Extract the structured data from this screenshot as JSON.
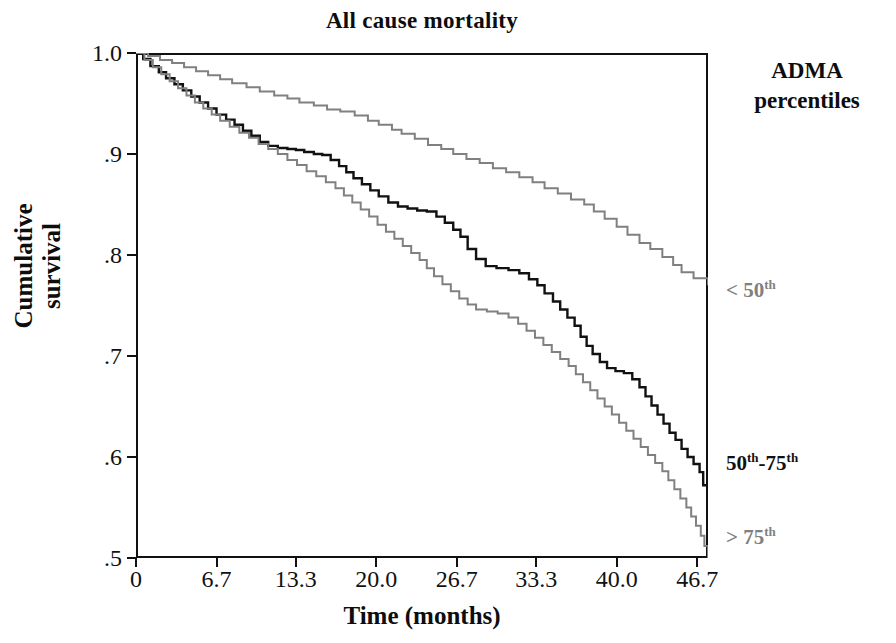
{
  "chart_data": {
    "type": "line",
    "title": "All cause mortality",
    "xlabel": "Time (months)",
    "ylabel": "Cumulative survival",
    "xlim": [
      0,
      47.6
    ],
    "ylim": [
      0.5,
      1.0
    ],
    "grid": false,
    "legend_position": "right",
    "legend_title_line1": "ADMA",
    "legend_title_line2": "percentiles",
    "xticks": [
      0,
      6.7,
      13.3,
      20.0,
      26.7,
      33.3,
      40.0,
      46.7
    ],
    "xtick_labels": [
      "0",
      "6.7",
      "13.3",
      "20.0",
      "26.7",
      "33.3",
      "40.0",
      "46.7"
    ],
    "yticks": [
      1.0,
      0.9,
      0.8,
      0.7,
      0.6,
      0.5
    ],
    "ytick_labels": [
      "1.0",
      ".9",
      ".8",
      ".7",
      ".6",
      ".5"
    ],
    "series": [
      {
        "name": "< 50th",
        "label_prefix": "< 50",
        "label_sup": "th",
        "color": "#808080",
        "width": 2.0,
        "label_y": 277,
        "final_value": 0.77,
        "points": [
          [
            0.0,
            1.0
          ],
          [
            1.0,
            0.997
          ],
          [
            2.0,
            0.993
          ],
          [
            3.0,
            0.99
          ],
          [
            4.0,
            0.986
          ],
          [
            5.0,
            0.982
          ],
          [
            6.0,
            0.978
          ],
          [
            7.0,
            0.974
          ],
          [
            8.0,
            0.97
          ],
          [
            9.2,
            0.966
          ],
          [
            10.3,
            0.962
          ],
          [
            11.5,
            0.958
          ],
          [
            12.6,
            0.955
          ],
          [
            13.6,
            0.951
          ],
          [
            14.8,
            0.948
          ],
          [
            15.9,
            0.944
          ],
          [
            17.0,
            0.942
          ],
          [
            18.2,
            0.938
          ],
          [
            19.3,
            0.933
          ],
          [
            20.2,
            0.929
          ],
          [
            21.3,
            0.924
          ],
          [
            22.1,
            0.92
          ],
          [
            23.2,
            0.915
          ],
          [
            24.3,
            0.909
          ],
          [
            25.4,
            0.905
          ],
          [
            26.4,
            0.9
          ],
          [
            27.5,
            0.895
          ],
          [
            28.6,
            0.891
          ],
          [
            29.7,
            0.886
          ],
          [
            30.8,
            0.882
          ],
          [
            31.9,
            0.877
          ],
          [
            33.0,
            0.872
          ],
          [
            34.0,
            0.866
          ],
          [
            35.1,
            0.861
          ],
          [
            36.2,
            0.855
          ],
          [
            37.3,
            0.85
          ],
          [
            38.1,
            0.843
          ],
          [
            39.0,
            0.836
          ],
          [
            40.0,
            0.828
          ],
          [
            40.9,
            0.82
          ],
          [
            41.9,
            0.812
          ],
          [
            42.8,
            0.806
          ],
          [
            43.8,
            0.798
          ],
          [
            44.7,
            0.79
          ],
          [
            45.4,
            0.783
          ],
          [
            46.4,
            0.777
          ],
          [
            47.6,
            0.77
          ]
        ]
      },
      {
        "name": "50th-75th",
        "label_prefix": "50",
        "label_sup": "th",
        "label_suffix": "-75",
        "label_sup2": "th",
        "color": "#111111",
        "width": 2.4,
        "label_y": 450,
        "final_value": 0.555,
        "points": [
          [
            0.0,
            1.0
          ],
          [
            0.6,
            0.994
          ],
          [
            1.2,
            0.987
          ],
          [
            1.9,
            0.981
          ],
          [
            2.5,
            0.975
          ],
          [
            3.2,
            0.969
          ],
          [
            3.9,
            0.963
          ],
          [
            4.6,
            0.957
          ],
          [
            5.3,
            0.951
          ],
          [
            6.0,
            0.945
          ],
          [
            6.7,
            0.939
          ],
          [
            7.5,
            0.934
          ],
          [
            8.2,
            0.929
          ],
          [
            8.9,
            0.923
          ],
          [
            9.6,
            0.918
          ],
          [
            10.3,
            0.912
          ],
          [
            11.0,
            0.908
          ],
          [
            11.8,
            0.906
          ],
          [
            12.6,
            0.905
          ],
          [
            13.3,
            0.904
          ],
          [
            14.0,
            0.902
          ],
          [
            14.8,
            0.9
          ],
          [
            15.5,
            0.899
          ],
          [
            16.2,
            0.894
          ],
          [
            16.9,
            0.888
          ],
          [
            17.5,
            0.882
          ],
          [
            18.1,
            0.876
          ],
          [
            18.8,
            0.87
          ],
          [
            19.5,
            0.864
          ],
          [
            20.2,
            0.858
          ],
          [
            21.0,
            0.852
          ],
          [
            21.8,
            0.848
          ],
          [
            22.6,
            0.846
          ],
          [
            23.4,
            0.844
          ],
          [
            24.2,
            0.843
          ],
          [
            25.0,
            0.838
          ],
          [
            25.7,
            0.832
          ],
          [
            26.4,
            0.825
          ],
          [
            27.0,
            0.818
          ],
          [
            27.6,
            0.806
          ],
          [
            28.3,
            0.796
          ],
          [
            29.1,
            0.789
          ],
          [
            30.0,
            0.787
          ],
          [
            31.0,
            0.785
          ],
          [
            31.9,
            0.782
          ],
          [
            32.7,
            0.776
          ],
          [
            33.4,
            0.77
          ],
          [
            34.0,
            0.762
          ],
          [
            34.7,
            0.754
          ],
          [
            35.3,
            0.746
          ],
          [
            35.9,
            0.738
          ],
          [
            36.5,
            0.73
          ],
          [
            37.0,
            0.719
          ],
          [
            37.5,
            0.71
          ],
          [
            38.0,
            0.702
          ],
          [
            38.6,
            0.694
          ],
          [
            39.2,
            0.688
          ],
          [
            39.9,
            0.685
          ],
          [
            40.6,
            0.683
          ],
          [
            41.3,
            0.677
          ],
          [
            41.9,
            0.669
          ],
          [
            42.4,
            0.66
          ],
          [
            42.9,
            0.651
          ],
          [
            43.4,
            0.642
          ],
          [
            43.9,
            0.633
          ],
          [
            44.4,
            0.624
          ],
          [
            44.9,
            0.617
          ],
          [
            45.4,
            0.608
          ],
          [
            45.9,
            0.6
          ],
          [
            46.4,
            0.593
          ],
          [
            46.9,
            0.585
          ],
          [
            47.2,
            0.572
          ],
          [
            47.6,
            0.555
          ]
        ]
      },
      {
        "name": "> 75th",
        "label_prefix": "> 75",
        "label_sup": "th",
        "color": "#808080",
        "width": 2.0,
        "label_y": 524,
        "final_value": 0.5,
        "points": [
          [
            0.0,
            1.0
          ],
          [
            0.7,
            0.993
          ],
          [
            1.4,
            0.986
          ],
          [
            2.1,
            0.979
          ],
          [
            2.8,
            0.972
          ],
          [
            3.5,
            0.965
          ],
          [
            4.2,
            0.958
          ],
          [
            4.9,
            0.951
          ],
          [
            5.6,
            0.945
          ],
          [
            6.3,
            0.939
          ],
          [
            7.0,
            0.933
          ],
          [
            7.8,
            0.927
          ],
          [
            8.6,
            0.921
          ],
          [
            9.4,
            0.916
          ],
          [
            10.2,
            0.91
          ],
          [
            11.0,
            0.905
          ],
          [
            11.8,
            0.9
          ],
          [
            12.6,
            0.894
          ],
          [
            13.4,
            0.889
          ],
          [
            14.2,
            0.883
          ],
          [
            15.0,
            0.878
          ],
          [
            15.8,
            0.872
          ],
          [
            16.6,
            0.866
          ],
          [
            17.3,
            0.859
          ],
          [
            18.0,
            0.852
          ],
          [
            18.7,
            0.845
          ],
          [
            19.4,
            0.838
          ],
          [
            20.1,
            0.83
          ],
          [
            20.8,
            0.823
          ],
          [
            21.5,
            0.816
          ],
          [
            22.2,
            0.809
          ],
          [
            22.9,
            0.802
          ],
          [
            23.6,
            0.795
          ],
          [
            24.2,
            0.787
          ],
          [
            24.8,
            0.779
          ],
          [
            25.5,
            0.771
          ],
          [
            26.2,
            0.764
          ],
          [
            26.9,
            0.757
          ],
          [
            27.6,
            0.751
          ],
          [
            28.3,
            0.746
          ],
          [
            29.2,
            0.744
          ],
          [
            30.1,
            0.742
          ],
          [
            31.0,
            0.738
          ],
          [
            31.8,
            0.732
          ],
          [
            32.5,
            0.725
          ],
          [
            33.2,
            0.718
          ],
          [
            33.9,
            0.711
          ],
          [
            34.6,
            0.704
          ],
          [
            35.3,
            0.697
          ],
          [
            36.0,
            0.69
          ],
          [
            36.6,
            0.682
          ],
          [
            37.2,
            0.674
          ],
          [
            37.8,
            0.666
          ],
          [
            38.4,
            0.658
          ],
          [
            39.0,
            0.65
          ],
          [
            39.6,
            0.642
          ],
          [
            40.2,
            0.634
          ],
          [
            40.8,
            0.626
          ],
          [
            41.4,
            0.618
          ],
          [
            42.0,
            0.61
          ],
          [
            42.6,
            0.602
          ],
          [
            43.2,
            0.594
          ],
          [
            43.8,
            0.586
          ],
          [
            44.3,
            0.577
          ],
          [
            44.8,
            0.568
          ],
          [
            45.3,
            0.559
          ],
          [
            45.8,
            0.55
          ],
          [
            46.2,
            0.541
          ],
          [
            46.6,
            0.532
          ],
          [
            47.0,
            0.522
          ],
          [
            47.3,
            0.512
          ],
          [
            47.6,
            0.5
          ]
        ]
      }
    ]
  }
}
